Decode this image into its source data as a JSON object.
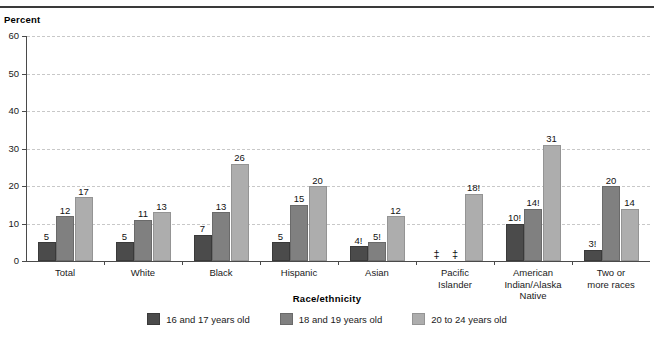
{
  "chart_data": {
    "type": "bar",
    "title": "",
    "ylabel": "Percent",
    "xlabel": "Race/ethnicity",
    "ylim": [
      0,
      60
    ],
    "yticks": [
      0,
      10,
      20,
      30,
      40,
      50,
      60
    ],
    "grid": true,
    "legend_position": "bottom",
    "categories": [
      "Total",
      "White",
      "Black",
      "Hispanic",
      "Asian",
      "Pacific\nIslander",
      "American\nIndian/Alaska\nNative",
      "Two or\nmore races"
    ],
    "series": [
      {
        "name": "16 and 17 years old",
        "color": "#4b4b4b",
        "values": [
          5,
          5,
          7,
          5,
          4,
          null,
          10,
          3
        ],
        "labels": [
          "5",
          "5",
          "7",
          "5",
          "4!",
          "‡",
          "10!",
          "3!"
        ]
      },
      {
        "name": "18 and 19 years old",
        "color": "#808080",
        "values": [
          12,
          11,
          13,
          15,
          5,
          null,
          14,
          20
        ],
        "labels": [
          "12",
          "11",
          "13",
          "15",
          "5!",
          "‡",
          "14!",
          "20"
        ]
      },
      {
        "name": "20 to 24 years old",
        "color": "#adadad",
        "values": [
          17,
          13,
          26,
          20,
          12,
          18,
          31,
          14
        ],
        "labels": [
          "17",
          "13",
          "26",
          "20",
          "12",
          "18!",
          "31",
          "14"
        ]
      }
    ]
  },
  "legend": {
    "items": [
      {
        "label": "16 and 17 years old"
      },
      {
        "label": "18 and 19 years old"
      },
      {
        "label": "20 to 24 years old"
      }
    ]
  }
}
